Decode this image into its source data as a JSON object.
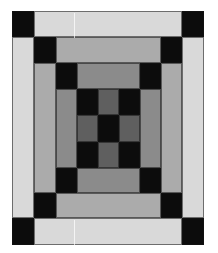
{
  "figure": {
    "colors": {
      "black": "#0c0c0c",
      "ring1_light": "#d9d9d9",
      "ring2_mid": "#ababab",
      "ring3_gray": "#8b8b8b",
      "center_dark": "#5f5f5f"
    },
    "grid": {
      "origin": [
        12,
        11
      ],
      "col_edges": [
        0,
        22,
        44,
        65,
        86,
        107,
        128,
        149,
        170,
        192
      ],
      "row_edges": [
        0,
        26,
        52,
        78,
        104,
        131,
        157,
        182,
        207,
        234
      ]
    },
    "patches": [
      {
        "name": "ring1-corner-top-left",
        "c": [
          0,
          1
        ],
        "r": [
          0,
          1
        ],
        "color": "black"
      },
      {
        "name": "ring1-strip-top",
        "c": [
          1,
          8
        ],
        "r": [
          0,
          1
        ],
        "color": "ring1_light"
      },
      {
        "name": "ring1-corner-top-right",
        "c": [
          8,
          9
        ],
        "r": [
          0,
          1
        ],
        "color": "black"
      },
      {
        "name": "ring1-strip-left",
        "c": [
          0,
          1
        ],
        "r": [
          1,
          8
        ],
        "color": "ring1_light"
      },
      {
        "name": "ring1-strip-right",
        "c": [
          8,
          9
        ],
        "r": [
          1,
          8
        ],
        "color": "ring1_light"
      },
      {
        "name": "ring1-corner-bottom-left",
        "c": [
          0,
          1
        ],
        "r": [
          8,
          9
        ],
        "color": "black"
      },
      {
        "name": "ring1-strip-bottom",
        "c": [
          1,
          8
        ],
        "r": [
          8,
          9
        ],
        "color": "ring1_light"
      },
      {
        "name": "ring1-corner-bottom-right",
        "c": [
          8,
          9
        ],
        "r": [
          8,
          9
        ],
        "color": "black"
      },
      {
        "name": "ring2-corner-top-left",
        "c": [
          1,
          2
        ],
        "r": [
          1,
          2
        ],
        "color": "black"
      },
      {
        "name": "ring2-strip-top",
        "c": [
          2,
          7
        ],
        "r": [
          1,
          2
        ],
        "color": "ring2_mid"
      },
      {
        "name": "ring2-corner-top-right",
        "c": [
          7,
          8
        ],
        "r": [
          1,
          2
        ],
        "color": "black"
      },
      {
        "name": "ring2-strip-left",
        "c": [
          1,
          2
        ],
        "r": [
          2,
          7
        ],
        "color": "ring2_mid"
      },
      {
        "name": "ring2-strip-right",
        "c": [
          7,
          8
        ],
        "r": [
          2,
          7
        ],
        "color": "ring2_mid"
      },
      {
        "name": "ring2-corner-bottom-left",
        "c": [
          1,
          2
        ],
        "r": [
          7,
          8
        ],
        "color": "black"
      },
      {
        "name": "ring2-strip-bottom",
        "c": [
          2,
          7
        ],
        "r": [
          7,
          8
        ],
        "color": "ring2_mid"
      },
      {
        "name": "ring2-corner-bottom-right",
        "c": [
          7,
          8
        ],
        "r": [
          7,
          8
        ],
        "color": "black"
      },
      {
        "name": "ring3-corner-top-left",
        "c": [
          2,
          3
        ],
        "r": [
          2,
          3
        ],
        "color": "black"
      },
      {
        "name": "ring3-strip-top",
        "c": [
          3,
          6
        ],
        "r": [
          2,
          3
        ],
        "color": "ring3_gray"
      },
      {
        "name": "ring3-corner-top-right",
        "c": [
          6,
          7
        ],
        "r": [
          2,
          3
        ],
        "color": "black"
      },
      {
        "name": "ring3-strip-left",
        "c": [
          2,
          3
        ],
        "r": [
          3,
          6
        ],
        "color": "ring3_gray"
      },
      {
        "name": "ring3-strip-right",
        "c": [
          6,
          7
        ],
        "r": [
          3,
          6
        ],
        "color": "ring3_gray"
      },
      {
        "name": "ring3-corner-bottom-left",
        "c": [
          2,
          3
        ],
        "r": [
          6,
          7
        ],
        "color": "black"
      },
      {
        "name": "ring3-strip-bottom",
        "c": [
          3,
          6
        ],
        "r": [
          6,
          7
        ],
        "color": "ring3_gray"
      },
      {
        "name": "ring3-corner-bottom-right",
        "c": [
          6,
          7
        ],
        "r": [
          6,
          7
        ],
        "color": "black"
      },
      {
        "name": "center-top-left",
        "c": [
          3,
          4
        ],
        "r": [
          3,
          4
        ],
        "color": "black"
      },
      {
        "name": "center-top",
        "c": [
          4,
          5
        ],
        "r": [
          3,
          4
        ],
        "color": "center_dark"
      },
      {
        "name": "center-top-right",
        "c": [
          5,
          6
        ],
        "r": [
          3,
          4
        ],
        "color": "black"
      },
      {
        "name": "center-left",
        "c": [
          3,
          4
        ],
        "r": [
          4,
          5
        ],
        "color": "center_dark"
      },
      {
        "name": "center-middle",
        "c": [
          4,
          5
        ],
        "r": [
          4,
          5
        ],
        "color": "black"
      },
      {
        "name": "center-right",
        "c": [
          5,
          6
        ],
        "r": [
          4,
          5
        ],
        "color": "center_dark"
      },
      {
        "name": "center-bottom-left",
        "c": [
          3,
          4
        ],
        "r": [
          5,
          6
        ],
        "color": "black"
      },
      {
        "name": "center-bottom",
        "c": [
          4,
          5
        ],
        "r": [
          5,
          6
        ],
        "color": "center_dark"
      },
      {
        "name": "center-bottom-right",
        "c": [
          5,
          6
        ],
        "r": [
          5,
          6
        ],
        "color": "black"
      }
    ],
    "artifacts": [
      {
        "x": 61,
        "y": 1,
        "h": 25
      },
      {
        "x": 61,
        "y": 208,
        "h": 25
      }
    ]
  }
}
